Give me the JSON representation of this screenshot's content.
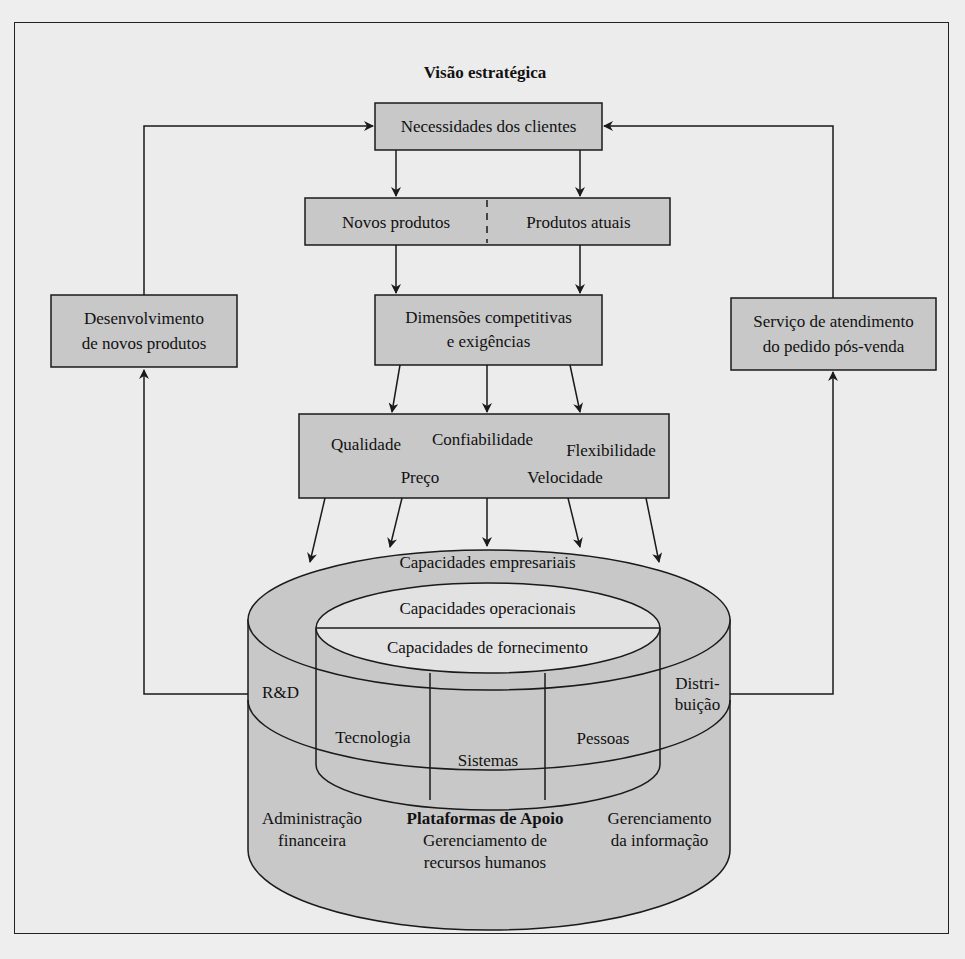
{
  "title": "Visão estratégica",
  "boxes": {
    "needs": "Necessidades dos clientes",
    "new_products": "Novos produtos",
    "current_products": "Produtos atuais",
    "competitive_1": "Dimensões competitivas",
    "competitive_2": "e exigências",
    "dev_1": "Desenvolvimento",
    "dev_2": "de novos produtos",
    "service_1": "Serviço de atendimento",
    "service_2": "do pedido pós-venda"
  },
  "dimensions": {
    "quality": "Qualidade",
    "reliability": "Confiabilidade",
    "flexibility": "Flexibilidade",
    "price": "Preço",
    "speed": "Velocidade"
  },
  "cylinder": {
    "enterprise": "Capacidades empresariais",
    "operational": "Capacidades operacionais",
    "supply": "Capacidades de fornecimento",
    "rd": "R&D",
    "distribution_1": "Distri-",
    "distribution_2": "buição",
    "technology": "Tecnologia",
    "systems": "Sistemas",
    "people": "Pessoas",
    "finance_1": "Administração",
    "finance_2": "financeira",
    "support": "Plataformas de Apoio",
    "hr_1": "Gerenciamento de",
    "hr_2": "recursos humanos",
    "info_1": "Gerenciamento",
    "info_2": "da informação"
  },
  "colors": {
    "box_fill": "#c8c8c8",
    "background": "#ececec",
    "stroke": "#1a1a1a"
  }
}
